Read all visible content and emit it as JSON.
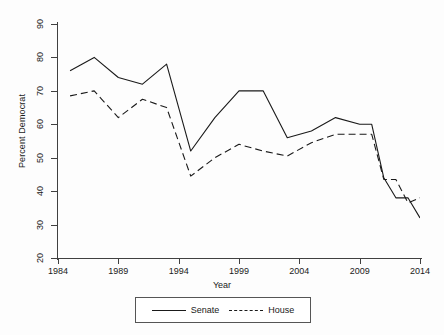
{
  "chart_data": {
    "type": "line",
    "title": "",
    "xlabel": "Year",
    "ylabel": "Percent Democrat",
    "xlim": [
      1984,
      2014
    ],
    "ylim": [
      20,
      90
    ],
    "xticks": [
      1984,
      1989,
      1994,
      1999,
      2004,
      2009,
      2014
    ],
    "yticks": [
      20,
      30,
      40,
      50,
      60,
      70,
      80,
      90
    ],
    "grid": false,
    "legend_position": "below",
    "series": [
      {
        "name": "Senate",
        "style": "solid",
        "color": "#1a1a1a",
        "x": [
          1985,
          1987,
          1989,
          1991,
          1993,
          1995,
          1997,
          1999,
          2001,
          2003,
          2005,
          2007,
          2009,
          2010,
          2011,
          2012,
          2013,
          2014
        ],
        "values": [
          76,
          80,
          74,
          72,
          78,
          52,
          62,
          70,
          70,
          56,
          58,
          62,
          60,
          60,
          44,
          38,
          38,
          32
        ]
      },
      {
        "name": "House",
        "style": "dashed",
        "color": "#1a1a1a",
        "x": [
          1985,
          1987,
          1989,
          1991,
          1993,
          1995,
          1997,
          1999,
          2001,
          2003,
          2005,
          2007,
          2009,
          2010,
          2011,
          2012,
          2013,
          2014
        ],
        "values": [
          68.5,
          70,
          62,
          67.5,
          65,
          44.5,
          50,
          54,
          52,
          50.5,
          54.5,
          57,
          57,
          57,
          43.5,
          43.5,
          36.5,
          38
        ]
      }
    ]
  },
  "axis": {
    "ylabel": "Percent Democrat",
    "xlabel": "Year",
    "yticklabels": [
      "20",
      "30",
      "40",
      "50",
      "60",
      "70",
      "80",
      "90"
    ],
    "xticklabels": [
      "1984",
      "1989",
      "1994",
      "1999",
      "2004",
      "2009",
      "2014"
    ]
  },
  "legend": {
    "entries": [
      {
        "label": "Senate",
        "style": "solid"
      },
      {
        "label": "House",
        "style": "dashed"
      }
    ]
  }
}
